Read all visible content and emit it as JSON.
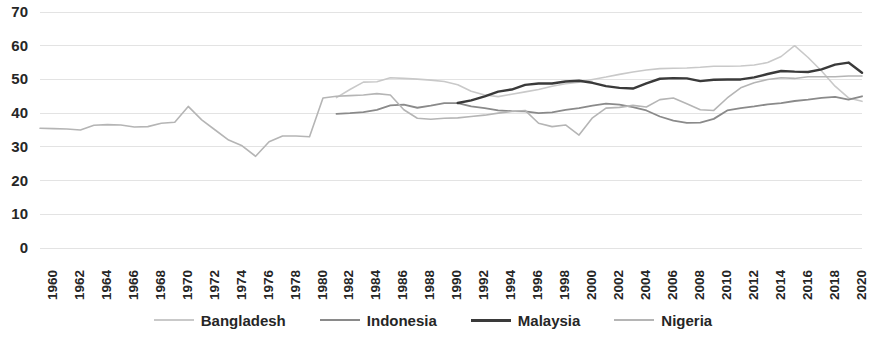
{
  "chart_data": {
    "type": "line",
    "title": "",
    "subtitle": "",
    "xlabel": "",
    "ylabel": "",
    "grid": true,
    "grid_axis": "y",
    "legend_position": "bottom",
    "xlim": [
      1960,
      2021
    ],
    "ylim": [
      0,
      70
    ],
    "y_ticks": [
      0,
      10,
      20,
      30,
      40,
      50,
      60,
      70
    ],
    "y_tick_labels": [
      "0",
      "10",
      "20",
      "30",
      "40",
      "50",
      "60",
      "70"
    ],
    "x_tick_labels": [
      "1960",
      "1962",
      "1964",
      "1966",
      "1968",
      "1970",
      "1972",
      "1974",
      "1976",
      "1978",
      "1980",
      "1982",
      "1984",
      "1986",
      "1988",
      "1990",
      "1992",
      "1994",
      "1996",
      "1998",
      "2000",
      "2002",
      "2004",
      "2006",
      "2008",
      "2010",
      "2012",
      "2014",
      "2016",
      "2018",
      "2020"
    ],
    "x_tick_values": [
      1960,
      1962,
      1964,
      1966,
      1968,
      1970,
      1972,
      1974,
      1976,
      1978,
      1980,
      1982,
      1984,
      1986,
      1988,
      1990,
      1992,
      1994,
      1996,
      1998,
      2000,
      2002,
      2004,
      2006,
      2008,
      2010,
      2012,
      2014,
      2016,
      2018,
      2020
    ],
    "series": [
      {
        "name": "Bangladesh",
        "color": "#c9c9c9",
        "width": 1.6,
        "x": [
          1982,
          1983,
          1984,
          1985,
          1986,
          1987,
          1988,
          1989,
          1990,
          1991,
          1992,
          1993,
          1994,
          1995,
          1996,
          1997,
          1998,
          1999,
          2000,
          2001,
          2002,
          2003,
          2004,
          2005,
          2006,
          2007,
          2008,
          2009,
          2010,
          2011,
          2012,
          2013,
          2014,
          2015,
          2016,
          2017,
          2018,
          2019,
          2020,
          2021
        ],
        "values": [
          44.6,
          47.0,
          49.2,
          49.3,
          50.5,
          50.3,
          50.1,
          49.8,
          49.4,
          48.4,
          46.5,
          45.4,
          44.9,
          45.6,
          46.3,
          47.0,
          48.0,
          48.7,
          49.2,
          50.0,
          50.7,
          51.5,
          52.2,
          52.8,
          53.2,
          53.3,
          53.4,
          53.6,
          53.9,
          53.9,
          54.0,
          54.3,
          55.0,
          56.8,
          60.0,
          56.5,
          52.5,
          48.0,
          44.5,
          43.5
        ]
      },
      {
        "name": "Indonesia",
        "color": "#8a8a8a",
        "width": 1.8,
        "x": [
          1982,
          1983,
          1984,
          1985,
          1986,
          1987,
          1988,
          1989,
          1990,
          1991,
          1992,
          1993,
          1994,
          1995,
          1996,
          1997,
          1998,
          1999,
          2000,
          2001,
          2002,
          2003,
          2004,
          2005,
          2006,
          2007,
          2008,
          2009,
          2010,
          2011,
          2012,
          2013,
          2014,
          2015,
          2016,
          2017,
          2018,
          2019,
          2020,
          2021
        ],
        "values": [
          39.8,
          40.0,
          40.3,
          41.0,
          42.3,
          42.5,
          41.6,
          42.2,
          43.0,
          43.0,
          42.0,
          41.5,
          40.8,
          40.6,
          40.5,
          40.0,
          40.2,
          41.0,
          41.5,
          42.2,
          42.8,
          42.5,
          41.8,
          40.8,
          39.0,
          37.8,
          37.1,
          37.2,
          38.3,
          40.8,
          41.5,
          42.0,
          42.6,
          43.0,
          43.6,
          44.0,
          44.5,
          44.8,
          44.0,
          45.0
        ]
      },
      {
        "name": "Malaysia",
        "color": "#3a3a3a",
        "width": 2.4,
        "x": [
          1991,
          1992,
          1993,
          1994,
          1995,
          1996,
          1997,
          1998,
          1999,
          2000,
          2001,
          2002,
          2003,
          2004,
          2005,
          2006,
          2007,
          2008,
          2009,
          2010,
          2011,
          2012,
          2013,
          2014,
          2015,
          2016,
          2017,
          2018,
          2019,
          2020,
          2021
        ],
        "values": [
          43.0,
          43.8,
          45.0,
          46.4,
          47.0,
          48.4,
          48.8,
          48.8,
          49.4,
          49.6,
          49.0,
          48.0,
          47.5,
          47.3,
          48.8,
          50.2,
          50.4,
          50.3,
          49.5,
          49.9,
          50.0,
          50.0,
          50.6,
          51.6,
          52.5,
          52.3,
          52.2,
          53.0,
          54.4,
          55.0,
          52.0
        ]
      },
      {
        "name": "Nigeria",
        "color": "#b5b5b5",
        "width": 1.6,
        "x": [
          1960,
          1961,
          1962,
          1963,
          1964,
          1965,
          1966,
          1967,
          1968,
          1969,
          1970,
          1971,
          1972,
          1973,
          1974,
          1975,
          1976,
          1977,
          1978,
          1979,
          1980,
          1981,
          1982,
          1983,
          1984,
          1985,
          1986,
          1987,
          1988,
          1989,
          1990,
          1991,
          1992,
          1993,
          1994,
          1995,
          1996,
          1997,
          1998,
          1999,
          2000,
          2001,
          2002,
          2003,
          2004,
          2005,
          2006,
          2007,
          2008,
          2009,
          2010,
          2011,
          2012,
          2013,
          2014,
          2015,
          2016,
          2017,
          2018,
          2019,
          2020,
          2021
        ],
        "values": [
          35.5,
          35.4,
          35.3,
          35.0,
          36.4,
          36.6,
          36.5,
          35.9,
          36.0,
          37.0,
          37.3,
          42.0,
          38.0,
          35.0,
          32.0,
          30.3,
          27.2,
          31.5,
          33.2,
          33.2,
          33.0,
          44.5,
          45.0,
          45.2,
          45.4,
          45.8,
          45.4,
          41.0,
          38.5,
          38.2,
          38.5,
          38.6,
          39.0,
          39.4,
          40.0,
          40.5,
          40.8,
          37.0,
          36.0,
          36.5,
          33.5,
          38.6,
          41.5,
          41.7,
          42.3,
          41.8,
          44.0,
          44.5,
          42.8,
          41.0,
          40.8,
          44.5,
          47.5,
          49.0,
          50.0,
          50.5,
          50.3,
          50.8,
          50.8,
          50.8,
          51.0,
          51.0
        ]
      }
    ]
  },
  "legend": {
    "items": [
      {
        "label": "Bangladesh",
        "color": "#c9c9c9",
        "width": 2
      },
      {
        "label": "Indonesia",
        "color": "#8a8a8a",
        "width": 2.5
      },
      {
        "label": "Malaysia",
        "color": "#3a3a3a",
        "width": 3
      },
      {
        "label": "Nigeria",
        "color": "#b5b5b5",
        "width": 2
      }
    ]
  },
  "axes": {
    "gridline_color": "#e3e3e3",
    "tick_label_color": "#262626"
  }
}
